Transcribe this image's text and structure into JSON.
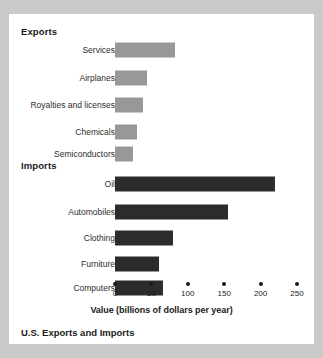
{
  "card": {
    "caption": "U.S. Exports and Imports"
  },
  "chart_data": {
    "type": "bar",
    "orientation": "horizontal",
    "title": "U.S. Exports and Imports",
    "xlabel": "Value (billions of dollars per year)",
    "ylabel": "",
    "xlim": [
      0,
      250
    ],
    "xticks": [
      0,
      50,
      100,
      150,
      200,
      250
    ],
    "xtick_labels": [
      "0",
      "50",
      "100",
      "150",
      "200",
      "250"
    ],
    "grid": false,
    "legend": false,
    "groups": [
      {
        "name": "Exports",
        "color": "#989898",
        "categories": [
          "Services",
          "Airplanes",
          "Royalties and licenses",
          "Chemicals",
          "Semiconductors"
        ],
        "values": [
          83,
          44,
          38,
          30,
          25
        ]
      },
      {
        "name": "Imports",
        "color": "#2c2c2c",
        "categories": [
          "Oil",
          "Automobiles",
          "Clothing",
          "Furniture",
          "Computers"
        ],
        "values": [
          220,
          155,
          80,
          60,
          66
        ]
      }
    ]
  }
}
